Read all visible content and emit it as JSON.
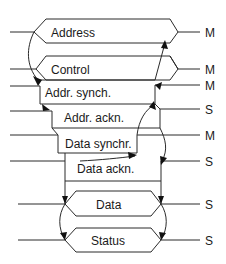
{
  "diagram": {
    "title": "",
    "signals": [
      {
        "id": "address",
        "label": "Address",
        "source": "M"
      },
      {
        "id": "control",
        "label": "Control",
        "source": "M"
      },
      {
        "id": "addr-synch",
        "label": "Addr. synch.",
        "source": "M"
      },
      {
        "id": "addr-ackn",
        "label": "Addr. ackn.",
        "source": "S"
      },
      {
        "id": "data-synchr",
        "label": "Data synchr.",
        "source": "M"
      },
      {
        "id": "data-ackn",
        "label": "Data ackn.",
        "source": "S"
      },
      {
        "id": "data",
        "label": "Data",
        "source": "S"
      },
      {
        "id": "status",
        "label": "Status",
        "source": "S"
      }
    ]
  }
}
